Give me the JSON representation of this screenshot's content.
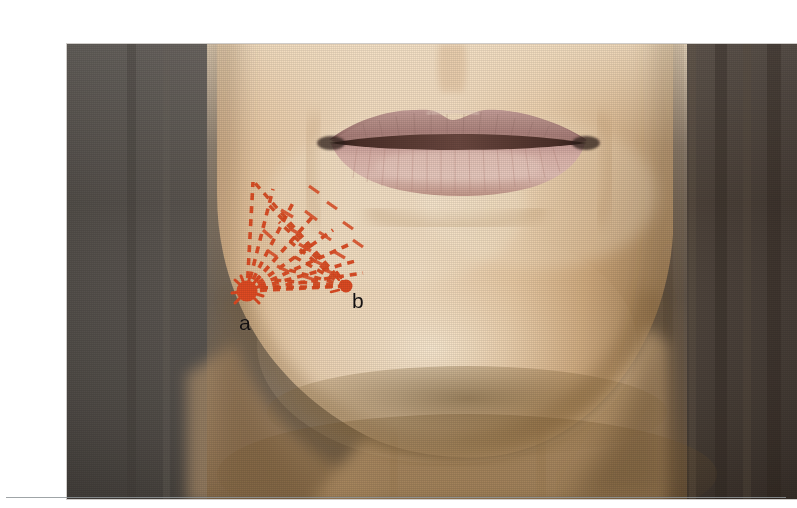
{
  "figure": {
    "kind": "clinical-photograph",
    "frame": {
      "x": 27,
      "y": 28,
      "width": 730,
      "height": 455
    },
    "background": {
      "left_panel_color": "#55504b",
      "right_panel_color": "#4a403a",
      "description": "dark neutral studio backdrop flanking the subject"
    },
    "skin": {
      "base_color": "#e2bd96",
      "highlight_color": "#f2dcc0",
      "shadow_color": "#a8875f",
      "jaw_shadow_color": "#6f5733"
    },
    "lips": {
      "upper_color": "#b08e8e",
      "lower_color": "#d8b2ac",
      "vermilion_border_color": "#8d6a66",
      "mouth_line_color": "#4a2f2b",
      "center_x": 398,
      "center_y": 103
    }
  },
  "annotation": {
    "color": "#dd4a22",
    "color_dark": "#c23c18",
    "label_color": "#141010",
    "description": "dashed fan of vectors radiating from point a and converging toward point b",
    "points": [
      {
        "id": "a",
        "label": "a",
        "cx": 180,
        "cy": 247,
        "r": 10.5,
        "label_x": 172,
        "label_y": 268
      },
      {
        "id": "b",
        "label": "b",
        "cx": 279,
        "cy": 242,
        "r": 6.5,
        "label_x": 285,
        "label_y": 246
      }
    ],
    "fan_a": {
      "origin_x": 180,
      "origin_y": 247,
      "ray_count": 9,
      "dash": "7 6",
      "stroke_width": 3.6,
      "endpoints": [
        {
          "x": 186,
          "y": 138
        },
        {
          "x": 206,
          "y": 145
        },
        {
          "x": 228,
          "y": 155
        },
        {
          "x": 248,
          "y": 170
        },
        {
          "x": 266,
          "y": 186
        },
        {
          "x": 281,
          "y": 201
        },
        {
          "x": 292,
          "y": 216
        },
        {
          "x": 296,
          "y": 229
        },
        {
          "x": 279,
          "y": 242
        }
      ]
    },
    "fan_b": {
      "origin_x": 279,
      "origin_y": 242,
      "ray_count": 8,
      "dash": "7 6",
      "stroke_width": 3.4,
      "endpoints": [
        {
          "x": 188,
          "y": 139
        },
        {
          "x": 201,
          "y": 160
        },
        {
          "x": 212,
          "y": 178
        },
        {
          "x": 221,
          "y": 196
        },
        {
          "x": 226,
          "y": 212
        },
        {
          "x": 222,
          "y": 226
        },
        {
          "x": 206,
          "y": 236
        },
        {
          "x": 190,
          "y": 244
        }
      ]
    },
    "splash_a": {
      "description": "irregular ink blot spikes around marker a",
      "spikes": 9
    }
  },
  "page": {
    "background_color": "#ffffff",
    "rule": {
      "x": 6,
      "y": 497,
      "width": 780,
      "color": "#8e9498"
    }
  }
}
